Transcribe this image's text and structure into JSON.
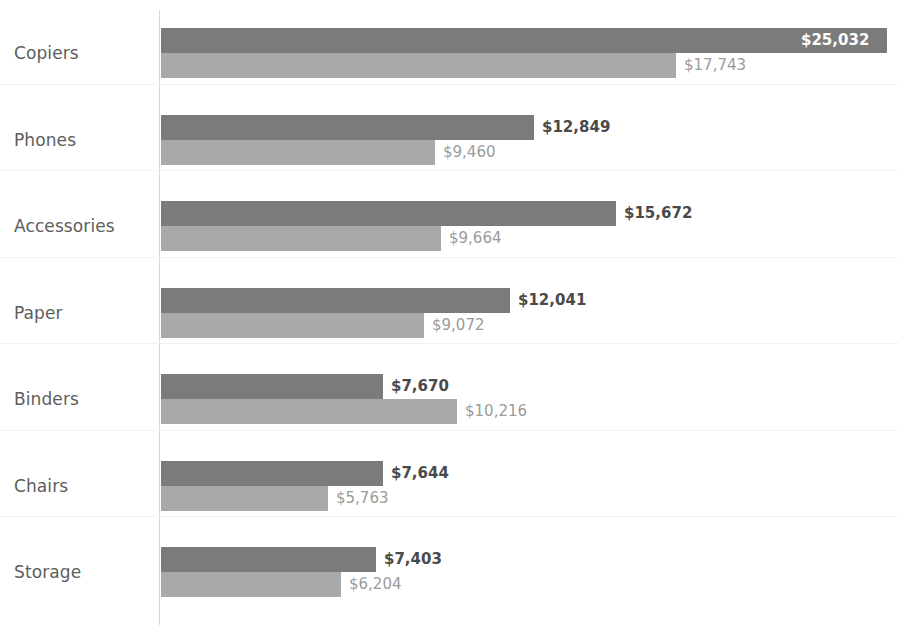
{
  "chart_data": {
    "type": "bar",
    "orientation": "horizontal",
    "grouped": true,
    "title": "",
    "subtitle": "",
    "xlabel": "",
    "ylabel": "",
    "grid": false,
    "legend": "none",
    "axis_line": true,
    "xlim": [
      0,
      25032
    ],
    "categories": [
      "Copiers",
      "Phones",
      "Accessories",
      "Paper",
      "Binders",
      "Chairs",
      "Storage"
    ],
    "series": [
      {
        "name": "primary",
        "color": "#7b7b7b",
        "values": [
          25032,
          12849,
          15672,
          12041,
          7670,
          7644,
          7403
        ],
        "labels": [
          "$25,032",
          "$12,849",
          "$15,672",
          "$12,041",
          "$7,670",
          "$7,644",
          "$7,403"
        ],
        "label_placement": [
          "inside",
          "outside",
          "outside",
          "outside",
          "outside",
          "outside",
          "outside"
        ],
        "label_color": "#4a4a4a",
        "label_color_inside": "#ffffff"
      },
      {
        "name": "secondary",
        "color": "#a9a9a9",
        "values": [
          17743,
          9460,
          9664,
          9072,
          10216,
          5763,
          6204
        ],
        "labels": [
          "$17,743",
          "$9,460",
          "$9,664",
          "$9,072",
          "$10,216",
          "$5,763",
          "$6,204"
        ],
        "label_placement": [
          "outside",
          "outside",
          "outside",
          "outside",
          "outside",
          "outside",
          "outside"
        ],
        "label_color": "#9b9b9b"
      }
    ],
    "rows": [
      {
        "category": "Copiers",
        "primary_value": 25032,
        "primary_label": "$25,032",
        "secondary_value": 17743,
        "secondary_label": "$17,743"
      },
      {
        "category": "Phones",
        "primary_value": 12849,
        "primary_label": "$12,849",
        "secondary_value": 9460,
        "secondary_label": "$9,460"
      },
      {
        "category": "Accessories",
        "primary_value": 15672,
        "primary_label": "$15,672",
        "secondary_value": 9664,
        "secondary_label": "$9,664"
      },
      {
        "category": "Paper",
        "primary_value": 12041,
        "primary_label": "$12,041",
        "secondary_value": 9072,
        "secondary_label": "$9,072"
      },
      {
        "category": "Binders",
        "primary_value": 7670,
        "primary_label": "$7,670",
        "secondary_value": 10216,
        "secondary_label": "$10,216"
      },
      {
        "category": "Chairs",
        "primary_value": 7644,
        "primary_label": "$7,644",
        "secondary_value": 5763,
        "secondary_label": "$5,763"
      },
      {
        "category": "Storage",
        "primary_value": 7403,
        "primary_label": "$7,403",
        "secondary_value": 6204,
        "secondary_label": "$6,204"
      }
    ]
  },
  "layout": {
    "plot_left": 161,
    "plot_max_width": 726,
    "first_bar_top": 28,
    "row_pitch": 86.5,
    "bar_height": 25,
    "label_offset": 8,
    "axis_x": 159
  }
}
